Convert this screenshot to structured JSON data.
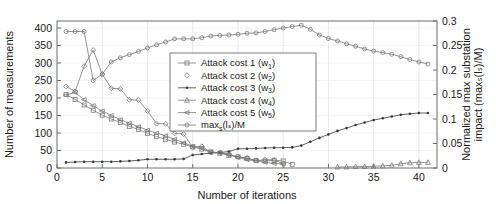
{
  "chart_data": {
    "type": "line",
    "title": "",
    "xlabel": "Number of iterations",
    "ylabel": "Number of measurements",
    "ylabel_right": "Normalized max substation impact (maxₛ(lₛ)/M)",
    "xlim": [
      0,
      42
    ],
    "ylim": [
      0,
      420
    ],
    "ylim_right": [
      0,
      0.3
    ],
    "grid": true,
    "legend_position": "center",
    "xticks": [
      0,
      5,
      10,
      15,
      20,
      25,
      30,
      35,
      40
    ],
    "xticklabels": [
      "0",
      "5",
      "10",
      "15",
      "20",
      "25",
      "30",
      "35",
      "40"
    ],
    "yticks": [
      0,
      50,
      100,
      150,
      200,
      250,
      300,
      350,
      400
    ],
    "yticklabels": [
      "0",
      "50",
      "100",
      "150",
      "200",
      "250",
      "300",
      "350",
      "400"
    ],
    "yticks_right": [
      0,
      0.05,
      0.1,
      0.15,
      0.2,
      0.25,
      0.3
    ],
    "yticklabels_right": [
      "0",
      "0.05",
      "0.1",
      "0.15",
      "0.2",
      "0.25",
      "0.3"
    ],
    "series": [
      {
        "name": "Attack cost 1 (w₁)",
        "legend_label": "Attack cost 1 (w",
        "legend_sub": "1",
        "legend_tail": ")",
        "marker": "square",
        "axis": "left",
        "color": "#7a7a7a",
        "x": [
          1,
          2,
          3,
          4,
          5,
          6,
          7,
          8,
          9,
          10,
          11,
          12,
          13,
          14,
          15,
          16,
          17,
          18,
          19,
          20,
          21,
          22,
          23,
          24,
          25,
          26
        ],
        "y": [
          210,
          196,
          180,
          165,
          151,
          140,
          130,
          119,
          110,
          99,
          90,
          82,
          74,
          68,
          60,
          54,
          46,
          42,
          36,
          32,
          27,
          22,
          20,
          22,
          20,
          10
        ]
      },
      {
        "name": "Attack cost 2 (w₂)",
        "legend_label": "Attack cost 2 (w",
        "legend_sub": "2",
        "legend_tail": ")",
        "marker": "diamond",
        "axis": "left",
        "color": "#7a7a7a",
        "x": [
          1,
          2,
          3,
          4,
          5,
          6,
          7,
          8,
          9,
          10,
          11,
          12,
          13,
          14,
          15,
          16,
          17,
          18,
          19,
          20,
          21,
          22,
          23,
          24,
          25
        ],
        "y": [
          233,
          219,
          291,
          337,
          268,
          228,
          226,
          195,
          194,
          163,
          127,
          126,
          99,
          97,
          60,
          62,
          45,
          44,
          39,
          32,
          29,
          21,
          24,
          23,
          12
        ]
      },
      {
        "name": "Attack cost 3 (w₃)",
        "legend_label": "Attack cost 3 (w",
        "legend_sub": "3",
        "legend_tail": ")",
        "marker": "dot",
        "axis": "left",
        "color": "#3a3a3a",
        "x": [
          1,
          2,
          3,
          4,
          5,
          6,
          7,
          8,
          9,
          10,
          11,
          12,
          13,
          14,
          15,
          16,
          17,
          18,
          19,
          20,
          21,
          22,
          23,
          24,
          25,
          26,
          27,
          28,
          29,
          30,
          31,
          32,
          33,
          34,
          35,
          36,
          37,
          38,
          39,
          40,
          41
        ],
        "y": [
          16,
          17,
          18,
          18,
          18,
          18,
          19,
          20,
          22,
          25,
          25,
          25,
          25,
          26,
          37,
          40,
          43,
          44,
          47,
          55,
          55,
          56,
          57,
          58,
          58,
          59,
          64,
          75,
          86,
          96,
          106,
          114,
          123,
          130,
          137,
          142,
          147,
          152,
          155,
          157,
          157
        ]
      },
      {
        "name": "Attack cost 4 (w₄)",
        "legend_label": "Attack cost 4 (w",
        "legend_sub": "4",
        "legend_tail": ")",
        "marker": "triangle",
        "axis": "left",
        "color": "#7a7a7a",
        "x": [
          31,
          32,
          33,
          34,
          35,
          36,
          37,
          38,
          39,
          40,
          41
        ],
        "y": [
          3,
          3,
          4,
          4,
          5,
          6,
          8,
          12,
          15,
          16,
          16
        ]
      },
      {
        "name": "Attack cost 5 (w₅)",
        "legend_label": "Attack cost 5 (w",
        "legend_sub": "5",
        "legend_tail": ")",
        "marker": "leftarrow",
        "axis": "left",
        "color": "#7a7a7a",
        "x": [
          1,
          2,
          3,
          4,
          5,
          6,
          7,
          8,
          9,
          10,
          11,
          12,
          13,
          14,
          15,
          16,
          17,
          18,
          19,
          20,
          21,
          22,
          23,
          24,
          25
        ],
        "y": [
          208,
          216,
          195,
          178,
          163,
          150,
          138,
          128,
          118,
          108,
          100,
          92,
          82,
          72,
          62,
          56,
          45,
          44,
          38,
          30,
          24,
          20,
          16,
          13,
          11
        ]
      },
      {
        "name": "maxₛ(lₛ)/M",
        "legend_label": "max",
        "legend_sub": "s",
        "legend_tail": "(lₛ)/M",
        "marker": "circle",
        "axis": "right",
        "color": "#7a7a7a",
        "x": [
          1,
          2,
          3,
          4,
          5,
          6,
          7,
          8,
          9,
          10,
          11,
          12,
          13,
          14,
          15,
          16,
          17,
          18,
          19,
          20,
          21,
          22,
          23,
          24,
          25,
          26,
          27,
          28,
          29,
          30,
          31,
          32,
          33,
          34,
          35,
          36,
          37,
          38,
          39,
          40,
          41
        ],
        "y_left_equiv": [
          390,
          390,
          390,
          250,
          268,
          303,
          315,
          324,
          333,
          343,
          352,
          360,
          369,
          369,
          369,
          372,
          377,
          379,
          380,
          382,
          385,
          386,
          390,
          395,
          400,
          404,
          408,
          396,
          380,
          370,
          363,
          355,
          348,
          340,
          334,
          330,
          325,
          318,
          310,
          303,
          297
        ]
      }
    ]
  }
}
